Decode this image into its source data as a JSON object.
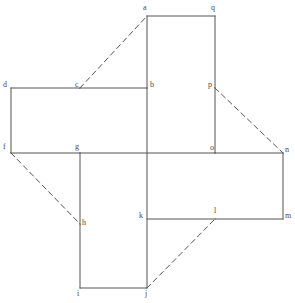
{
  "figure": {
    "canvas": {
      "width": 295,
      "height": 303
    },
    "style": {
      "solid_stroke_color": "#555555",
      "dashed_stroke_color": "#555555",
      "label_color": "#4a4a4a",
      "background_color": "#ffffff",
      "solid_stroke_width": 1,
      "dashed_stroke_width": 1,
      "dash_pattern": "5,4"
    },
    "vertices": [
      {
        "id": "a",
        "label": "a",
        "x": 147,
        "y": 16,
        "label_x": 143,
        "label_y": 4
      },
      {
        "id": "q",
        "label": "q",
        "x": 215,
        "y": 16,
        "label_x": 211,
        "label_y": 4
      },
      {
        "id": "b",
        "label": "b",
        "x": 147,
        "y": 88,
        "label_x": 150,
        "label_y": 81
      },
      {
        "id": "p",
        "label": "p",
        "x": 215,
        "y": 88,
        "label_x": 208,
        "label_y": 81
      },
      {
        "id": "d",
        "label": "d",
        "x": 11,
        "y": 88,
        "label_x": 3,
        "label_y": 81
      },
      {
        "id": "c",
        "label": "c",
        "x": 80,
        "y": 88,
        "label_x": 75,
        "label_y": 81
      },
      {
        "id": "f",
        "label": "f",
        "x": 11,
        "y": 153,
        "label_x": 3,
        "label_y": 143
      },
      {
        "id": "g",
        "label": "g",
        "x": 80,
        "y": 153,
        "label_x": 75,
        "label_y": 143
      },
      {
        "id": "o",
        "label": "o",
        "x": 215,
        "y": 153,
        "label_x": 210,
        "label_y": 144
      },
      {
        "id": "n",
        "label": "n",
        "x": 283,
        "y": 153,
        "label_x": 285,
        "label_y": 146
      },
      {
        "id": "h",
        "label": "h",
        "x": 80,
        "y": 224,
        "label_x": 82,
        "label_y": 219
      },
      {
        "id": "k",
        "label": "k",
        "x": 147,
        "y": 219,
        "label_x": 139,
        "label_y": 212
      },
      {
        "id": "l",
        "label": "l",
        "x": 215,
        "y": 219,
        "label_x": 214,
        "label_y": 207
      },
      {
        "id": "m",
        "label": "m",
        "x": 283,
        "y": 219,
        "label_x": 285,
        "label_y": 212
      },
      {
        "id": "i",
        "label": "i",
        "x": 80,
        "y": 288,
        "label_x": 77,
        "label_y": 290
      },
      {
        "id": "j",
        "label": "j",
        "x": 147,
        "y": 288,
        "label_x": 145,
        "label_y": 290
      }
    ],
    "solid_edges": [
      {
        "name": "edge-a-q",
        "from": "a",
        "to": "q"
      },
      {
        "name": "edge-a-b",
        "from": "a",
        "to": "b"
      },
      {
        "name": "edge-q-p",
        "from": "q",
        "to": "p"
      },
      {
        "name": "edge-p-o",
        "from": "p",
        "to": "o"
      },
      {
        "name": "edge-d-c",
        "from": "d",
        "to": "c"
      },
      {
        "name": "edge-c-b",
        "from": "c",
        "to": "b"
      },
      {
        "name": "edge-d-f",
        "from": "d",
        "to": "f"
      },
      {
        "name": "edge-f-g",
        "from": "f",
        "to": "g"
      },
      {
        "name": "edge-g-o",
        "from": "g",
        "to": "o"
      },
      {
        "name": "edge-o-n",
        "from": "o",
        "to": "n"
      },
      {
        "name": "edge-b-j",
        "from": "b",
        "to": "j"
      },
      {
        "name": "edge-g-h",
        "from": "g",
        "to": "h"
      },
      {
        "name": "edge-h-i",
        "from": "h",
        "to": "i"
      },
      {
        "name": "edge-i-j",
        "from": "i",
        "to": "j"
      },
      {
        "name": "edge-k-l",
        "from": "k",
        "to": "l"
      },
      {
        "name": "edge-l-m",
        "from": "l",
        "to": "m"
      },
      {
        "name": "edge-n-m",
        "from": "n",
        "to": "m"
      }
    ],
    "dashed_edges": [
      {
        "name": "dashed-c-a",
        "from": "c",
        "to": "a"
      },
      {
        "name": "dashed-p-n",
        "from": "p",
        "to": "n"
      },
      {
        "name": "dashed-f-h",
        "from": "f",
        "to": "h"
      },
      {
        "name": "dashed-j-l",
        "from": "j",
        "to": "l"
      }
    ]
  }
}
